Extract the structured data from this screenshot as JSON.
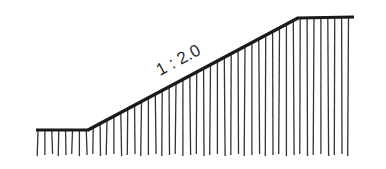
{
  "diagram": {
    "type": "slope-cross-section",
    "slope_label": "1 : 2.0",
    "colors": {
      "line": "#1a1a1a",
      "hatch": "#333333",
      "background": "#ffffff"
    },
    "profile": {
      "lower_flat": {
        "x1": 36,
        "y1": 130,
        "x2": 88,
        "y2": 130
      },
      "slope": {
        "x1": 88,
        "y1": 130,
        "x2": 298,
        "y2": 18
      },
      "upper_flat": {
        "x1": 298,
        "y1": 18,
        "x2": 354,
        "y2": 17
      }
    },
    "hatch_bottom_y": 156
  }
}
